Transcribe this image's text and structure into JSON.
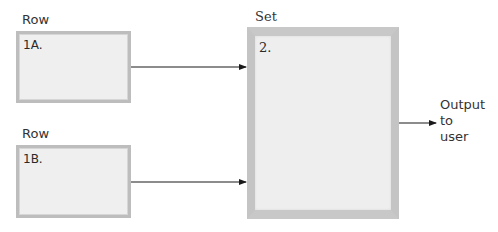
{
  "diagram": {
    "row_a": {
      "label": "Row",
      "id": "1A."
    },
    "row_b": {
      "label": "Row",
      "id": "1B."
    },
    "set": {
      "label": "Set",
      "id": "2."
    },
    "output": {
      "lines": [
        "Output",
        "to",
        "user"
      ]
    },
    "colors": {
      "box_fill": "#efefef",
      "box_border": "#bdbdbd",
      "arrow": "#1a1a1a"
    }
  }
}
